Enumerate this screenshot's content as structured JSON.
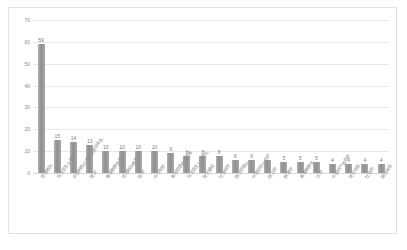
{
  "chart_data": {
    "type": "bar",
    "title": "",
    "xlabel": "",
    "ylabel": "",
    "ylim": [
      0,
      70
    ],
    "yticks": [
      70,
      60,
      50,
      40,
      30,
      20,
      10,
      0
    ],
    "grid": true,
    "legend": false,
    "bar_color": "#9a9a9a",
    "categories": [
      "思想政治",
      "马克思主义理论",
      "中国特色社会主义理论体系",
      "党史",
      "高等教育管理",
      "思想政治教育",
      "哲学",
      "中共党史",
      "高校思想政治教育",
      "马克思主义中国化",
      "党的建设",
      "社会科学",
      "政治学理论",
      "中国近现代史",
      "政治学",
      "教育学",
      "高等教育学",
      "法学",
      "中国共产党历史",
      "党的领导",
      "社会学",
      "国际关系"
    ],
    "values": [
      59,
      15,
      14,
      13,
      10,
      10,
      10,
      10,
      9,
      8,
      8,
      8,
      6,
      6,
      6,
      5,
      5,
      5,
      4,
      4,
      4,
      4
    ],
    "data_labels": [
      "59",
      "15",
      "14",
      "13",
      "10",
      "10",
      "10",
      "10",
      "9",
      "8",
      "8",
      "8",
      "6",
      "6",
      "6",
      "5",
      "5",
      "5",
      "4",
      "4",
      "4",
      "4"
    ]
  },
  "caption": {
    "text": ""
  }
}
